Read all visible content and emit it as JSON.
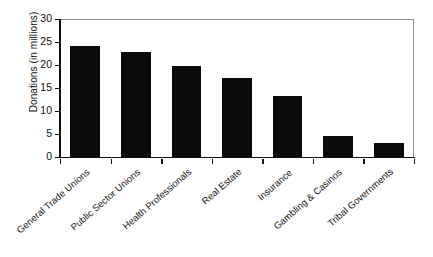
{
  "chart_data": {
    "type": "bar",
    "title": "",
    "subtitle": "",
    "xlabel": "",
    "ylabel": "Donations (in millions)",
    "categories": [
      "General Trade Unions",
      "Public Sector Unions",
      "Health Professionals",
      "Real Estate",
      "Insurance",
      "Gambling & Casinos",
      "Tribal Governments"
    ],
    "values": [
      24.2,
      22.8,
      19.7,
      17.2,
      13.2,
      4.5,
      3.1
    ],
    "ylim": [
      0,
      30
    ],
    "ytick_labels": [
      "0",
      "5",
      "10",
      "15",
      "20",
      "25",
      "30"
    ],
    "ytick_values": [
      0,
      5,
      10,
      15,
      20,
      25,
      30
    ],
    "grid": false,
    "legend": false,
    "legend_position": "none",
    "bar_color": "#0b0b0b",
    "background_color": "#ffffff",
    "axis_color": "#111111",
    "frame_color": "#8d8d8d"
  }
}
